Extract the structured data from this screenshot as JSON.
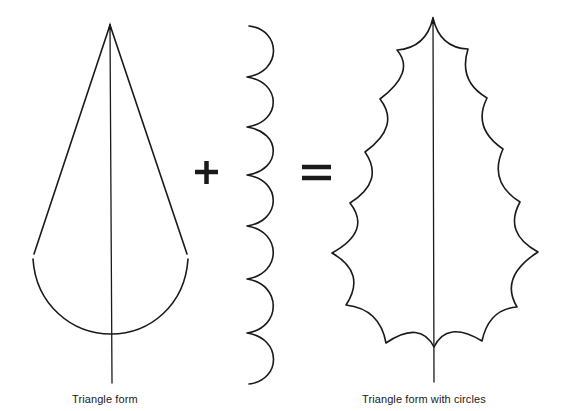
{
  "figure": {
    "type": "illustration-equation",
    "colors": {
      "ink": "#1a1a1a",
      "background": "#ffffff"
    },
    "components": [
      {
        "id": "triangle-form",
        "label": "Triangle form"
      },
      {
        "id": "operator-plus",
        "symbol": "+"
      },
      {
        "id": "scalloped-circles",
        "label": "",
        "scallop_count": 7
      },
      {
        "id": "operator-equals",
        "symbol": "="
      },
      {
        "id": "triangle-form-with-circles",
        "label": "Triangle form with circles",
        "points_per_side": 7
      }
    ]
  },
  "captions": {
    "left": "Triangle form",
    "right": "Triangle form with circles"
  }
}
